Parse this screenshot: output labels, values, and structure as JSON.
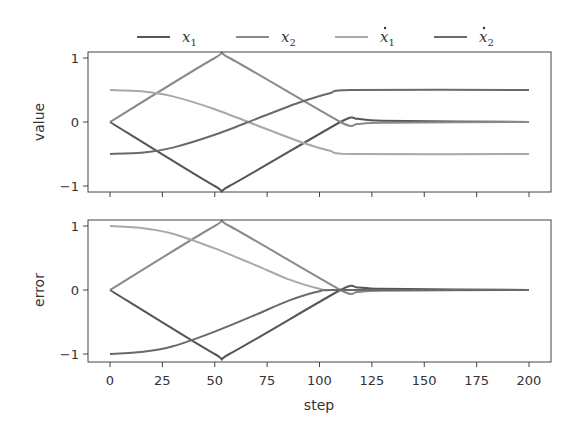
{
  "chart_data": [
    {
      "type": "line",
      "title": "",
      "xlabel": "",
      "ylabel": "value",
      "xlim": [
        -6,
        210
      ],
      "ylim": [
        -1.05,
        1.05
      ],
      "xticks": [
        0,
        25,
        50,
        75,
        100,
        125,
        150,
        175,
        200
      ],
      "yticks": [
        -1,
        0,
        1
      ],
      "ytick_labels": [
        "−1",
        "0",
        "1"
      ],
      "grid": false,
      "series": [
        {
          "name": "x1",
          "color": "#555555",
          "points": [
            [
              0,
              0
            ],
            [
              50,
              -1
            ],
            [
              57,
              -1
            ],
            [
              110,
              0
            ],
            [
              118,
              0.05
            ],
            [
              130,
              0.02
            ],
            [
              200,
              0
            ]
          ]
        },
        {
          "name": "x2",
          "color": "#8a8a8a",
          "points": [
            [
              0,
              0
            ],
            [
              50,
              1
            ],
            [
              57,
              1
            ],
            [
              110,
              0
            ],
            [
              118,
              -0.03
            ],
            [
              130,
              -0.01
            ],
            [
              200,
              0
            ]
          ]
        },
        {
          "name": "x1_dot",
          "color": "#a8a8a8",
          "points": [
            [
              0,
              0.5
            ],
            [
              15,
              0.48
            ],
            [
              30,
              0.4
            ],
            [
              50,
              0.2
            ],
            [
              70,
              -0.05
            ],
            [
              90,
              -0.3
            ],
            [
              105,
              -0.45
            ],
            [
              115,
              -0.5
            ],
            [
              200,
              -0.5
            ]
          ]
        },
        {
          "name": "x2_dot",
          "color": "#6a6a6a",
          "points": [
            [
              0,
              -0.5
            ],
            [
              15,
              -0.48
            ],
            [
              30,
              -0.4
            ],
            [
              50,
              -0.2
            ],
            [
              70,
              0.05
            ],
            [
              90,
              0.3
            ],
            [
              105,
              0.45
            ],
            [
              115,
              0.5
            ],
            [
              200,
              0.5
            ]
          ]
        }
      ]
    },
    {
      "type": "line",
      "title": "",
      "xlabel": "step",
      "ylabel": "error",
      "xlim": [
        -6,
        210
      ],
      "ylim": [
        -1.05,
        1.05
      ],
      "xticks": [
        0,
        25,
        50,
        75,
        100,
        125,
        150,
        175,
        200
      ],
      "yticks": [
        -1,
        0,
        1
      ],
      "ytick_labels": [
        "−1",
        "0",
        "1"
      ],
      "grid": false,
      "series": [
        {
          "name": "x1",
          "color": "#555555",
          "points": [
            [
              0,
              0
            ],
            [
              50,
              -1
            ],
            [
              57,
              -1
            ],
            [
              110,
              0
            ],
            [
              118,
              0.04
            ],
            [
              130,
              0.02
            ],
            [
              200,
              0
            ]
          ]
        },
        {
          "name": "x2",
          "color": "#8a8a8a",
          "points": [
            [
              0,
              0
            ],
            [
              50,
              1
            ],
            [
              57,
              1
            ],
            [
              110,
              0
            ],
            [
              118,
              -0.03
            ],
            [
              130,
              -0.01
            ],
            [
              200,
              0
            ]
          ]
        },
        {
          "name": "x1_dot",
          "color": "#a8a8a8",
          "points": [
            [
              0,
              1
            ],
            [
              15,
              0.97
            ],
            [
              30,
              0.88
            ],
            [
              50,
              0.65
            ],
            [
              70,
              0.38
            ],
            [
              85,
              0.17
            ],
            [
              100,
              0.02
            ],
            [
              110,
              0
            ],
            [
              200,
              0
            ]
          ]
        },
        {
          "name": "x2_dot",
          "color": "#6a6a6a",
          "points": [
            [
              0,
              -1
            ],
            [
              15,
              -0.97
            ],
            [
              30,
              -0.88
            ],
            [
              50,
              -0.65
            ],
            [
              70,
              -0.38
            ],
            [
              85,
              -0.17
            ],
            [
              100,
              -0.02
            ],
            [
              110,
              0
            ],
            [
              200,
              0
            ]
          ]
        }
      ]
    }
  ],
  "legend": {
    "position": "top",
    "entries": [
      {
        "label": "x",
        "sub": "1",
        "dot": false,
        "color": "#555555"
      },
      {
        "label": "x",
        "sub": "2",
        "dot": false,
        "color": "#8a8a8a"
      },
      {
        "label": "x",
        "sub": "1",
        "dot": true,
        "color": "#a8a8a8"
      },
      {
        "label": "x",
        "sub": "2",
        "dot": true,
        "color": "#6a6a6a"
      }
    ]
  },
  "labels": {
    "top_ylabel": "value",
    "bottom_ylabel": "error",
    "xlabel": "step",
    "xtick_labels": [
      "0",
      "25",
      "50",
      "75",
      "100",
      "125",
      "150",
      "175",
      "200"
    ],
    "ytick_labels": [
      "1",
      "0",
      "−1"
    ]
  }
}
